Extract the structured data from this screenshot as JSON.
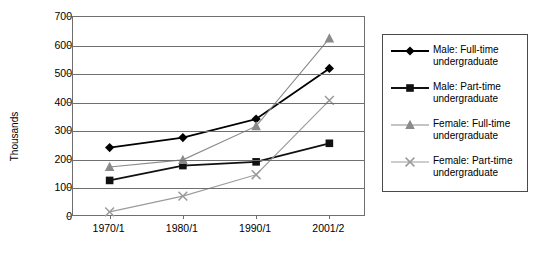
{
  "chart_data": {
    "type": "line",
    "title": "",
    "xlabel": "",
    "ylabel": "Thousands",
    "categories": [
      "1970/1",
      "1980/1",
      "1990/1",
      "2001/2"
    ],
    "ylim": [
      0,
      700
    ],
    "yticks": [
      0,
      100,
      200,
      300,
      400,
      500,
      600,
      700
    ],
    "grid": true,
    "legend_position": "right",
    "series": [
      {
        "name": "Male: Full-time undergraduate",
        "label_line1": "Male: Full-time",
        "label_line2": "undergraduate",
        "marker": "diamond",
        "color": "#000000",
        "values": [
          243,
          278,
          343,
          520
        ]
      },
      {
        "name": "Male: Part-time undergraduate",
        "label_line1": "Male: Part-time",
        "label_line2": "undergraduate",
        "marker": "square",
        "color": "#111111",
        "values": [
          128,
          180,
          193,
          258
        ]
      },
      {
        "name": "Female: Full-time undergraduate",
        "label_line1": "Female: Full-time",
        "label_line2": "undergraduate",
        "marker": "triangle",
        "color": "#8a8a8a",
        "values": [
          175,
          200,
          318,
          625
        ]
      },
      {
        "name": "Female: Part-time undergraduate",
        "label_line1": "Female: Part-time",
        "label_line2": "undergraduate",
        "marker": "cross",
        "color": "#9b9b9b",
        "values": [
          18,
          73,
          148,
          408
        ]
      }
    ]
  },
  "axis": {
    "y_tick_labels": [
      "700",
      "600",
      "500",
      "400",
      "300",
      "200",
      "100",
      "0"
    ],
    "y_axis_title": "Thousands",
    "x_tick_labels": [
      "1970/1",
      "1980/1",
      "1990/1",
      "2001/2"
    ]
  },
  "colors": {
    "frame": "#6f6f6f",
    "gridline": "#6f6f6f",
    "legend_border": "#4a4a4a",
    "male_full": "#000000",
    "male_part": "#111111",
    "female_full": "#8a8a8a",
    "female_part": "#9b9b9b",
    "background": "#ffffff"
  }
}
